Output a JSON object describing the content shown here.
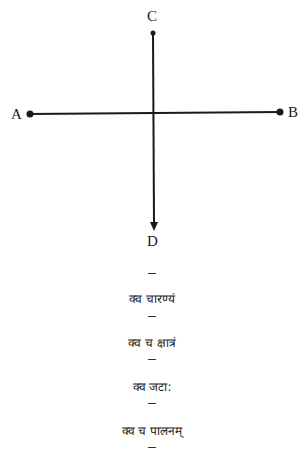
{
  "diagram": {
    "labels": {
      "top": "C",
      "bottom": "D",
      "left": "A",
      "right": "B"
    },
    "lines": [
      {
        "id": "AB",
        "from": "A",
        "to": "B",
        "end_markers": [
          "dot",
          "dot"
        ]
      },
      {
        "id": "CD",
        "from": "C",
        "to": "D",
        "end_markers": [
          "dot",
          "arrow"
        ]
      }
    ],
    "stroke_color": "#1a1a1a"
  },
  "verses": [
    {
      "text": "क्व चारण्यं"
    },
    {
      "text": "क्व च क्षात्रं"
    },
    {
      "text": "क्व जटा:"
    },
    {
      "text": "क्व च पालनम्"
    }
  ],
  "separator": "–"
}
